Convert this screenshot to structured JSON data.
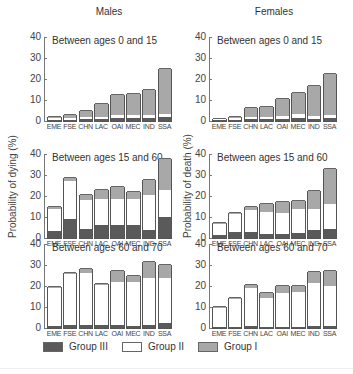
{
  "columns": {
    "left_title": "Males",
    "right_title": "Females"
  },
  "y_axis_labels": {
    "males": "Probability of dying (%)",
    "females": "Probability of death (%)"
  },
  "y_ticks": [
    "0",
    "10",
    "20",
    "30",
    "40"
  ],
  "categories": [
    "EME",
    "FSE",
    "CHN",
    "LAC",
    "OAI",
    "MEC",
    "IND",
    "SSA"
  ],
  "legend": [
    {
      "label": "Group III",
      "color": "#5a5a5a"
    },
    {
      "label": "Group II",
      "color": "#ffffff"
    },
    {
      "label": "Group I",
      "color": "#a8a8a8"
    }
  ],
  "chart_data": [
    {
      "type": "bar",
      "stacked": true,
      "sex": "Males",
      "title": "Between ages 0 and 15",
      "categories": [
        "EME",
        "FSE",
        "CHN",
        "LAC",
        "OAI",
        "MEC",
        "IND",
        "SSA"
      ],
      "series": [
        {
          "name": "Group III",
          "values": [
            0.5,
            0.5,
            1.0,
            0.8,
            1.5,
            1.5,
            1.5,
            2.0
          ]
        },
        {
          "name": "Group II",
          "values": [
            1.0,
            1.0,
            1.0,
            1.0,
            1.5,
            1.5,
            1.5,
            1.5
          ]
        },
        {
          "name": "Group I",
          "values": [
            0.5,
            1.5,
            3.0,
            6.2,
            9.2,
            10.0,
            12.0,
            21.5
          ]
        }
      ],
      "totals": [
        2,
        3,
        5,
        8,
        12.2,
        13,
        15,
        25
      ],
      "ylabel": "",
      "ylim": [
        0,
        40
      ]
    },
    {
      "type": "bar",
      "stacked": true,
      "sex": "Females",
      "title": "Between ages 0 and 15",
      "categories": [
        "EME",
        "FSE",
        "CHN",
        "LAC",
        "OAI",
        "MEC",
        "IND",
        "SSA"
      ],
      "series": [
        {
          "name": "Group III",
          "values": [
            0.3,
            0.4,
            0.8,
            0.8,
            1.0,
            1.2,
            1.0,
            1.5
          ]
        },
        {
          "name": "Group II",
          "values": [
            0.5,
            0.8,
            1.2,
            1.2,
            1.5,
            2.0,
            1.5,
            1.5
          ]
        },
        {
          "name": "Group I",
          "values": [
            0.2,
            0.8,
            4.0,
            4.5,
            8.0,
            10.0,
            14.0,
            19.5
          ]
        }
      ],
      "totals": [
        1,
        2,
        6,
        6.5,
        10.5,
        13.2,
        16.5,
        22.5
      ],
      "ylabel": "",
      "ylim": [
        0,
        40
      ]
    },
    {
      "type": "bar",
      "stacked": true,
      "sex": "Males",
      "title": "Between ages 15 and 60",
      "categories": [
        "EME",
        "FSE",
        "CHN",
        "LAC",
        "OAI",
        "MEC",
        "IND",
        "SSA"
      ],
      "series": [
        {
          "name": "Group III",
          "values": [
            3.5,
            9.0,
            4.5,
            6.0,
            6.2,
            6.2,
            4.0,
            10.0
          ]
        },
        {
          "name": "Group II",
          "values": [
            10.5,
            18.0,
            13.5,
            12.7,
            12.3,
            12.3,
            16.5,
            13.0
          ]
        },
        {
          "name": "Group I",
          "values": [
            1.0,
            1.5,
            2.5,
            4.3,
            6.0,
            3.5,
            7.0,
            14.5
          ]
        }
      ],
      "totals": [
        15,
        28.5,
        20.5,
        23,
        24.5,
        22,
        27.5,
        37.5
      ],
      "ylabel": "Probability of dying (%)",
      "ylim": [
        0,
        40
      ]
    },
    {
      "type": "bar",
      "stacked": true,
      "sex": "Females",
      "title": "Between ages 15 and 60",
      "categories": [
        "EME",
        "FSE",
        "CHN",
        "LAC",
        "OAI",
        "MEC",
        "IND",
        "SSA"
      ],
      "series": [
        {
          "name": "Group III",
          "values": [
            1.5,
            3.0,
            3.0,
            2.0,
            2.0,
            2.5,
            4.0,
            4.5
          ]
        },
        {
          "name": "Group II",
          "values": [
            5.0,
            8.5,
            10.5,
            10.5,
            10.0,
            11.5,
            10.0,
            11.5
          ]
        },
        {
          "name": "Group I",
          "values": [
            0.5,
            0.5,
            1.5,
            3.5,
            5.0,
            3.5,
            8.5,
            17.0
          ]
        }
      ],
      "totals": [
        7,
        12,
        15,
        16,
        17,
        17.5,
        22.5,
        33
      ],
      "ylabel": "Probability of death (%)",
      "ylim": [
        0,
        40
      ]
    },
    {
      "type": "bar",
      "stacked": true,
      "sex": "Males",
      "title": "Between ages 60 and 70",
      "categories": [
        "EME",
        "FSE",
        "CHN",
        "LAC",
        "OAI",
        "MEC",
        "IND",
        "SSA"
      ],
      "series": [
        {
          "name": "Group III",
          "values": [
            1.0,
            1.5,
            1.5,
            1.5,
            1.5,
            1.0,
            1.5,
            2.5
          ]
        },
        {
          "name": "Group II",
          "values": [
            18.0,
            24.0,
            24.5,
            19.0,
            20.5,
            21.0,
            22.5,
            21.5
          ]
        },
        {
          "name": "Group I",
          "values": [
            0.5,
            0.5,
            2.0,
            0.5,
            5.0,
            3.0,
            7.5,
            6.0
          ]
        }
      ],
      "totals": [
        19.5,
        26,
        28,
        21,
        27,
        25,
        31.5,
        30
      ],
      "ylabel": "",
      "ylim": [
        0,
        40
      ]
    },
    {
      "type": "bar",
      "stacked": true,
      "sex": "Females",
      "title": "Between ages 60 and 70",
      "categories": [
        "EME",
        "FSE",
        "CHN",
        "LAC",
        "OAI",
        "MEC",
        "IND",
        "SSA"
      ],
      "series": [
        {
          "name": "Group III",
          "values": [
            0.3,
            0.3,
            1.0,
            0.5,
            0.5,
            0.5,
            1.0,
            1.0
          ]
        },
        {
          "name": "Group II",
          "values": [
            9.2,
            13.7,
            18.0,
            14.0,
            16.0,
            16.5,
            20.5,
            19.0
          ]
        },
        {
          "name": "Group I",
          "values": [
            0.5,
            0.5,
            1.5,
            2.0,
            3.5,
            3.0,
            5.0,
            7.0
          ]
        }
      ],
      "totals": [
        10,
        14.5,
        20.5,
        16.5,
        20,
        20,
        26.5,
        27
      ],
      "ylabel": "",
      "ylim": [
        0,
        40
      ]
    }
  ]
}
